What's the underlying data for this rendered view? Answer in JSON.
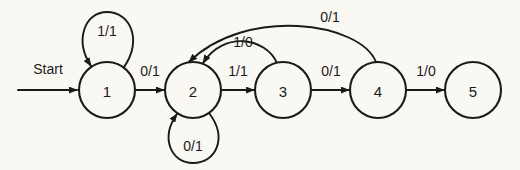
{
  "diagram": {
    "type": "finite-state-machine",
    "label_format": "input/output",
    "background_color": "#faf8f2",
    "stroke_color": "#1a1a1a",
    "start_label": "Start",
    "states": [
      {
        "id": "1",
        "label": "1",
        "cx": 107,
        "cy": 90,
        "r": 28
      },
      {
        "id": "2",
        "label": "2",
        "cx": 193,
        "cy": 90,
        "r": 28
      },
      {
        "id": "3",
        "label": "3",
        "cx": 283,
        "cy": 90,
        "r": 28
      },
      {
        "id": "4",
        "label": "4",
        "cx": 378,
        "cy": 90,
        "r": 28
      },
      {
        "id": "5",
        "label": "5",
        "cx": 473,
        "cy": 90,
        "r": 28
      }
    ],
    "transitions": [
      {
        "id": "t-start",
        "from": "start",
        "to": "1",
        "label": "Start",
        "kind": "start-arrow",
        "label_x": 48,
        "label_y": 69
      },
      {
        "id": "t-1-1",
        "from": "1",
        "to": "1",
        "label": "1/1",
        "kind": "self-loop-top",
        "label_x": 107,
        "label_y": 30
      },
      {
        "id": "t-1-2",
        "from": "1",
        "to": "2",
        "label": "0/1",
        "kind": "straight",
        "label_x": 150,
        "label_y": 71
      },
      {
        "id": "t-2-2",
        "from": "2",
        "to": "2",
        "label": "0/1",
        "kind": "self-loop-bottom",
        "label_x": 193,
        "label_y": 146
      },
      {
        "id": "t-2-3",
        "from": "2",
        "to": "3",
        "label": "1/1",
        "kind": "straight",
        "label_x": 238,
        "label_y": 71
      },
      {
        "id": "t-3-2",
        "from": "3",
        "to": "2",
        "label": "1/0",
        "kind": "arc-back-short",
        "label_x": 243,
        "label_y": 42
      },
      {
        "id": "t-3-4",
        "from": "3",
        "to": "4",
        "label": "0/1",
        "kind": "straight",
        "label_x": 331,
        "label_y": 71
      },
      {
        "id": "t-4-2",
        "from": "4",
        "to": "2",
        "label": "0/1",
        "kind": "arc-back-long",
        "label_x": 330,
        "label_y": 17
      },
      {
        "id": "t-4-5",
        "from": "4",
        "to": "5",
        "label": "1/0",
        "kind": "straight",
        "label_x": 426,
        "label_y": 71
      }
    ]
  }
}
